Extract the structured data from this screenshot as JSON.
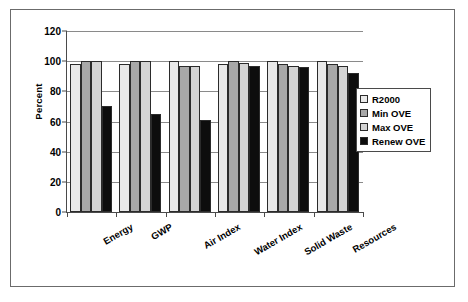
{
  "chart_data": {
    "type": "bar",
    "title": "",
    "xlabel": "",
    "ylabel": "Percent",
    "ylim": [
      0,
      120
    ],
    "yticks": [
      0,
      20,
      40,
      60,
      80,
      100,
      120
    ],
    "grid": true,
    "legend_position": "right",
    "categories": [
      "Energy",
      "GWP",
      "Air Index",
      "Water Index",
      "Solid Waste",
      "Resources"
    ],
    "series": [
      {
        "name": "R2000",
        "values": [
          98,
          98,
          100,
          98,
          100,
          100
        ]
      },
      {
        "name": "Min OVE",
        "values": [
          100,
          100,
          97,
          100,
          98,
          98
        ]
      },
      {
        "name": "Max OVE",
        "values": [
          100,
          100,
          97,
          99,
          97,
          97
        ]
      },
      {
        "name": "Renew OVE",
        "values": [
          70,
          65,
          61,
          97,
          96,
          92
        ]
      }
    ]
  },
  "legend": {
    "items": [
      {
        "label": "R2000",
        "swatch": "light-grid-swatch"
      },
      {
        "label": "Min OVE",
        "swatch": "dark-grid-swatch"
      },
      {
        "label": "Max OVE",
        "swatch": "light-gray-swatch"
      },
      {
        "label": "Renew OVE",
        "swatch": "black-swatch"
      }
    ]
  },
  "colors": {
    "r2000": "#e9e9e9",
    "min_ove": "#a8a8a8",
    "max_ove": "#d4d4d4",
    "renew_ove": "#0d0d0d",
    "axis": "#4a4a4a",
    "grid": "#8a8a8a",
    "frame": "#6b6b6b"
  }
}
